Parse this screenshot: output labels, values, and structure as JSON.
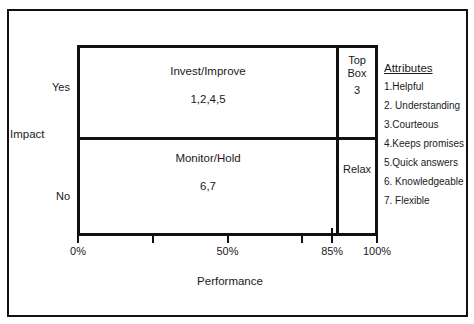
{
  "diagram": {
    "axes": {
      "y_title": "Impact",
      "y_labels": {
        "high": "Yes",
        "low": "No"
      },
      "x_title": "Performance",
      "x_ticks": [
        {
          "label": "0%",
          "value": 0,
          "style": "short"
        },
        {
          "label": "",
          "value": 25,
          "style": "short"
        },
        {
          "label": "50%",
          "value": 50,
          "style": "short"
        },
        {
          "label": "",
          "value": 75,
          "style": "short"
        },
        {
          "label": "85%",
          "value": 85,
          "style": "tall"
        },
        {
          "label": "100%",
          "value": 100,
          "style": "tall"
        }
      ]
    },
    "quadrants": {
      "invest": {
        "title": "Invest/Improve",
        "items": "1,2,4,5"
      },
      "monitor": {
        "title": "Monitor/Hold",
        "items": "6,7"
      },
      "top_box": {
        "title_line1": "Top",
        "title_line2": "Box",
        "items": "3"
      },
      "relax": {
        "title": "Relax",
        "items": ""
      }
    }
  },
  "attributes": {
    "heading": "Attributes",
    "items": [
      "1.Helpful",
      "2. Understanding",
      "3.Courteous",
      "4.Keeps promises",
      "5.Quick answers",
      "6. Knowledgeable",
      "7. Flexible"
    ]
  },
  "colors": {
    "ink": "#111111",
    "background": "#ffffff"
  }
}
